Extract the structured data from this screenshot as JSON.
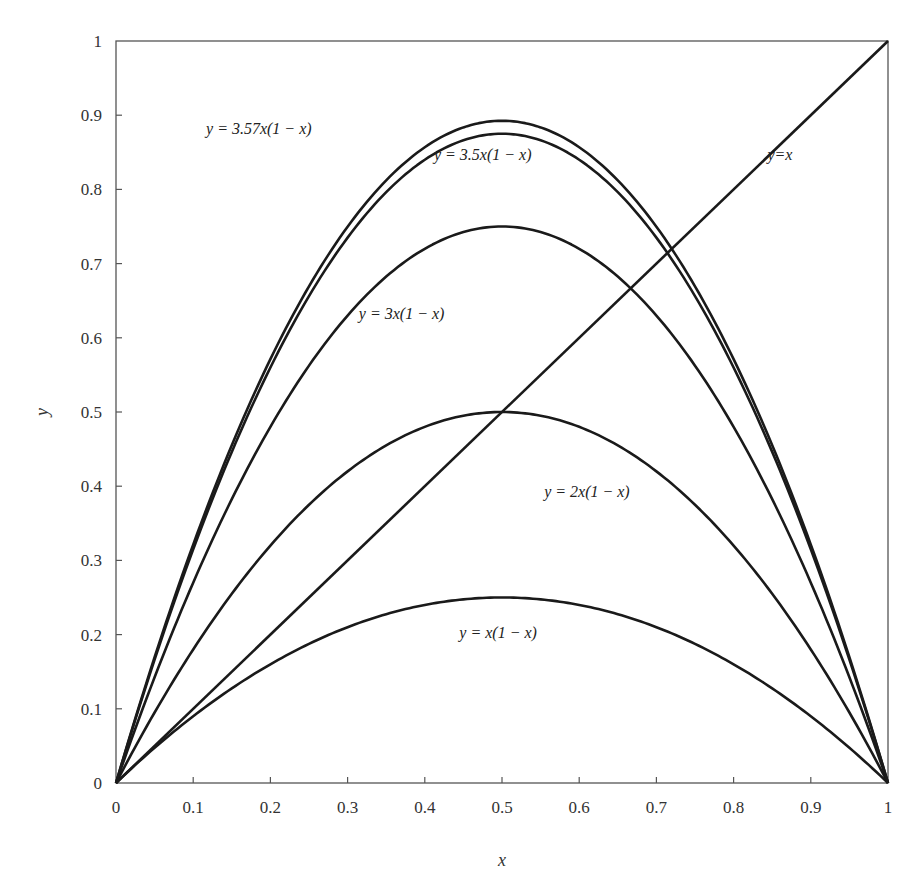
{
  "chart_data": {
    "type": "line",
    "title": "",
    "xlabel": "x",
    "ylabel": "y",
    "xlim": [
      0,
      1
    ],
    "ylim": [
      0,
      1
    ],
    "grid": false,
    "legend": "none (inline curve labels)",
    "x_ticks": [
      "0",
      "0.1",
      "0.2",
      "0.3",
      "0.4",
      "0.5",
      "0.6",
      "0.7",
      "0.8",
      "0.9",
      "1"
    ],
    "y_ticks": [
      "0",
      "0.1",
      "0.2",
      "0.3",
      "0.4",
      "0.5",
      "0.6",
      "0.7",
      "0.8",
      "0.9",
      "1"
    ],
    "x": [
      0,
      0.1,
      0.2,
      0.3,
      0.4,
      0.5,
      0.6,
      0.7,
      0.8,
      0.9,
      1
    ],
    "series": [
      {
        "name": "y = x(1 − x)",
        "r": 1,
        "values": [
          0,
          0.09,
          0.16,
          0.21,
          0.24,
          0.25,
          0.24,
          0.21,
          0.16,
          0.09,
          0
        ],
        "label_pos": [
          0.495,
          0.195
        ]
      },
      {
        "name": "y = 2x(1 − x)",
        "r": 2,
        "values": [
          0,
          0.18,
          0.32,
          0.42,
          0.48,
          0.5,
          0.48,
          0.42,
          0.32,
          0.18,
          0
        ],
        "label_pos": [
          0.61,
          0.385
        ]
      },
      {
        "name": "y = 3x(1 − x)",
        "r": 3,
        "values": [
          0,
          0.27,
          0.48,
          0.63,
          0.72,
          0.75,
          0.72,
          0.63,
          0.48,
          0.27,
          0
        ],
        "label_pos": [
          0.37,
          0.625
        ]
      },
      {
        "name": "y = 3.5x(1 − x)",
        "r": 3.5,
        "values": [
          0,
          0.315,
          0.56,
          0.735,
          0.84,
          0.875,
          0.84,
          0.735,
          0.56,
          0.315,
          0
        ],
        "label_pos": [
          0.475,
          0.84
        ]
      },
      {
        "name": "y = 3.57x(1 − x)",
        "r": 3.57,
        "values": [
          0,
          0.3213,
          0.5712,
          0.7497,
          0.8568,
          0.8925,
          0.8568,
          0.7497,
          0.5712,
          0.3213,
          0
        ],
        "label_pos": [
          0.185,
          0.875
        ]
      },
      {
        "name": "y=x",
        "r": null,
        "values": [
          0,
          0.1,
          0.2,
          0.3,
          0.4,
          0.5,
          0.6,
          0.7,
          0.8,
          0.9,
          1
        ],
        "label_pos": [
          0.86,
          0.84
        ]
      }
    ]
  }
}
